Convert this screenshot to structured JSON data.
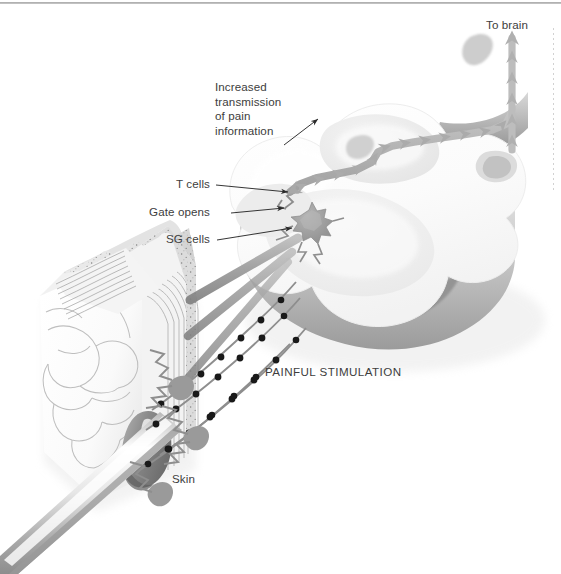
{
  "figure": {
    "background_color": "#ffffff",
    "text_color": "#3d3d3d"
  },
  "labels": {
    "to_brain": "To brain",
    "increased_transmission": "Increased\ntransmission\nof pain\ninformation",
    "increased_transmission_lines": [
      "Increased",
      "transmission",
      "of pain",
      "information"
    ],
    "t_cells": "T cells",
    "gate_opens": "Gate opens",
    "sg_cells": "SG cells",
    "painful_stimulation": "PAINFUL STIMULATION",
    "skin": "Skin"
  },
  "structures": {
    "spinal_cord": {
      "name": "spinal-cord-slab",
      "fill": "#fbfbfb",
      "grey_matter_fill": "#f0f0f0",
      "side_wall_fill": "#c9c9c9",
      "shadow_fill": "#9d9d9d"
    },
    "t_cell_axon": {
      "name": "t-cell-axon-tract",
      "color": "#b5b5b5",
      "arrowheads": 18,
      "direction": "toward brain"
    },
    "ascending_tract": {
      "name": "ascending-tract-to-brain",
      "color": "#bdbdbd",
      "arrowheads": 6,
      "direction": "up"
    },
    "sg_cell": {
      "name": "sg-cell-body",
      "fill": "#9a9a9a",
      "shape": "stellate",
      "spikes": 13
    },
    "gate": {
      "name": "gate-synapse-open",
      "state": "open",
      "stroke": "#8f8f8f"
    },
    "nerve_fibers": {
      "name": "afferent-nerve-fibers",
      "fiber_color": "#9e9e9e",
      "node_color": "#1b1b1b",
      "count": 4,
      "ganglia": 3,
      "ganglion_fill": "#909090"
    },
    "skin_block": {
      "name": "skin-cross-section",
      "epidermis_fill": "#e9e9e9",
      "epidermis_stipple": "#5a5a5a",
      "dermis_fill": "#fafafa",
      "dermis_line": "#b0b0b0",
      "hair_follicle_fill": "#8e8e8e"
    },
    "needle": {
      "name": "needle-stimulus",
      "fill": "#d6d6d6",
      "highlight": "#ffffff",
      "edge": "#8a8a8a"
    },
    "top_rule": {
      "name": "page-top-rule",
      "color": "#a9a9a9"
    },
    "edge_dots": {
      "name": "page-edge-dotted-line",
      "color": "#c2c2c2"
    }
  }
}
